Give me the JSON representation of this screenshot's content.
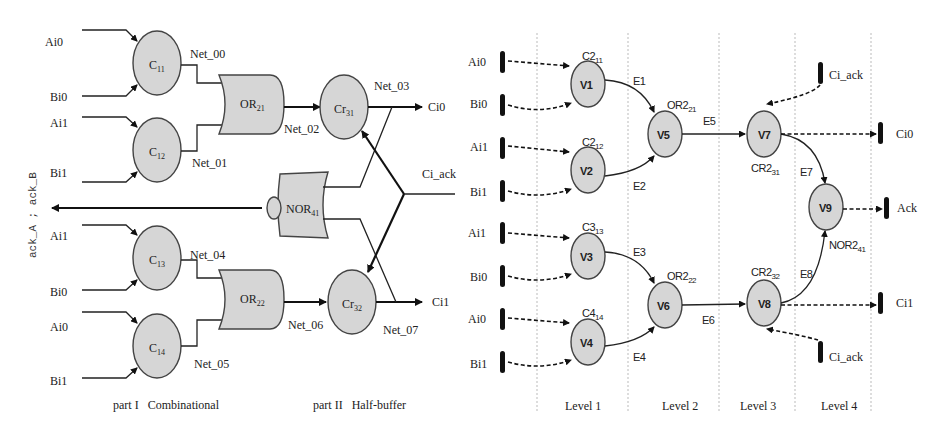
{
  "left_circuit": {
    "side_label": "ack_A ; ack_B",
    "inputs": {
      "c11": [
        "Ai0",
        "Bi0"
      ],
      "c12": [
        "Ai1",
        "Bi1"
      ],
      "c13": [
        "Ai1",
        "Bi0"
      ],
      "c14": [
        "Ai0",
        "Bi1"
      ]
    },
    "gates": {
      "c11": {
        "base": "C",
        "sub": "11"
      },
      "c12": {
        "base": "C",
        "sub": "12"
      },
      "c13": {
        "base": "C",
        "sub": "13"
      },
      "c14": {
        "base": "C",
        "sub": "14"
      },
      "or21": {
        "base": "OR",
        "sub": "21"
      },
      "or22": {
        "base": "OR",
        "sub": "22"
      },
      "nor41": {
        "base": "NOR",
        "sub": "41"
      },
      "cr31": {
        "base": "Cr",
        "sub": "31"
      },
      "cr32": {
        "base": "Cr",
        "sub": "32"
      }
    },
    "nets": {
      "net00": "Net_00",
      "net01": "Net_01",
      "net02": "Net_02",
      "net03": "Net_03",
      "net04": "Net_04",
      "net05": "Net_05",
      "net06": "Net_06",
      "net07": "Net_07"
    },
    "outputs": {
      "ci0": "Ci0",
      "ci1": "Ci1",
      "ci_ack": "Ci_ack"
    },
    "captions": {
      "part1": "part I   Combinational",
      "part2": "part II   Half-buffer"
    }
  },
  "right_graph": {
    "inputs": [
      "Ai0",
      "Bi0",
      "Ai1",
      "Bi1",
      "Ai1",
      "Bi0",
      "Ai0",
      "Bi1"
    ],
    "nodes": {
      "v1": {
        "label": "V1",
        "tag": "C2",
        "sub": "11"
      },
      "v2": {
        "label": "V2",
        "tag": "C2",
        "sub": "12"
      },
      "v3": {
        "label": "V3",
        "tag": "C3",
        "sub": "13"
      },
      "v4": {
        "label": "V4",
        "tag": "C4",
        "sub": "14"
      },
      "v5": {
        "label": "V5",
        "tag": "OR2",
        "sub": "21"
      },
      "v6": {
        "label": "V6",
        "tag": "OR2",
        "sub": "22"
      },
      "v7": {
        "label": "V7",
        "tag": "CR2",
        "sub": "31"
      },
      "v8": {
        "label": "V8",
        "tag": "CR2",
        "sub": "32"
      },
      "v9": {
        "label": "V9",
        "tag": "NOR2",
        "sub": "41"
      }
    },
    "edges": {
      "e1": "E1",
      "e2": "E2",
      "e3": "E3",
      "e4": "E4",
      "e5": "E5",
      "e6": "E6",
      "e7": "E7",
      "e8": "E8"
    },
    "outputs": {
      "ci0": "Ci0",
      "ack": "Ack",
      "ci1": "Ci1",
      "ci_ack_top": "Ci_ack",
      "ci_ack_bottom": "Ci_ack"
    },
    "levels": [
      "Level 1",
      "Level 2",
      "Level 3",
      "Level 4"
    ]
  }
}
